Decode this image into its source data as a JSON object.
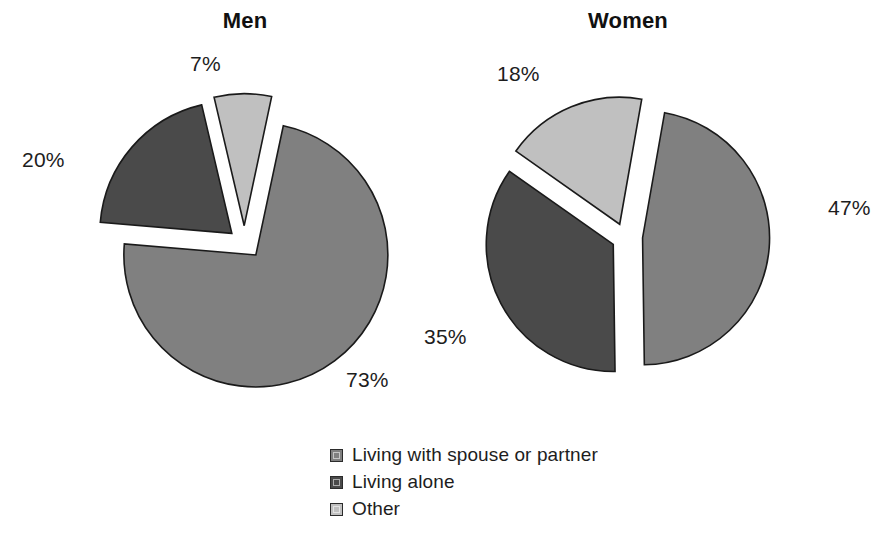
{
  "chart_data": {
    "type": "pie",
    "title": "",
    "charts": [
      {
        "title": "Men",
        "center": [
          245,
          242
        ],
        "radius": 132,
        "categories": [
          "Living with spouse or partner",
          "Living alone",
          "Other"
        ],
        "values": [
          73,
          20,
          7
        ],
        "labels": [
          "73%",
          "20%",
          "7%"
        ],
        "colors": [
          "#808080",
          "#4a4a4a",
          "#c0c0c0"
        ],
        "exploded": true,
        "label_positions": [
          [
            346,
            368
          ],
          [
            22,
            148
          ],
          [
            190,
            52
          ]
        ]
      },
      {
        "title": "Women",
        "center": [
          627,
          237
        ],
        "radius": 127,
        "categories": [
          "Living with spouse or partner",
          "Living alone",
          "Other"
        ],
        "values": [
          47,
          35,
          18
        ],
        "labels": [
          "47%",
          "35%",
          "18%"
        ],
        "colors": [
          "#808080",
          "#4a4a4a",
          "#c0c0c0"
        ],
        "exploded": true,
        "label_positions": [
          [
            828,
            196
          ],
          [
            424,
            325
          ],
          [
            497,
            62
          ]
        ]
      }
    ],
    "legend": {
      "position": "bottom-center",
      "entries": [
        {
          "label": "Living with spouse or partner",
          "color": "#808080"
        },
        {
          "label": "Living alone",
          "color": "#4a4a4a"
        },
        {
          "label": "Other",
          "color": "#c0c0c0"
        }
      ]
    },
    "xlabel": "",
    "ylabel": "",
    "grid": false
  },
  "figure": {
    "background": "#ffffff",
    "outline_color": "#1a1a1a"
  }
}
